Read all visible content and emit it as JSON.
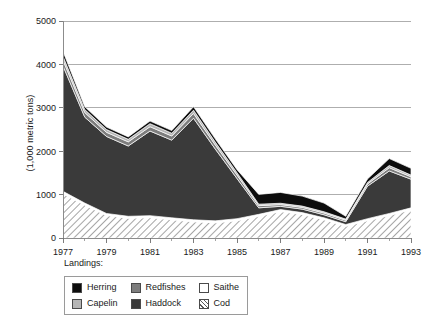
{
  "chart_data": {
    "type": "area",
    "stacked": true,
    "title": "",
    "xlabel": "",
    "ylabel": "(1,000 metric tons)",
    "legend_title": "Landings:",
    "legend_position": "bottom",
    "grid": true,
    "xlim": [
      1977,
      1993
    ],
    "ylim": [
      0,
      5000
    ],
    "yticks": [
      0,
      1000,
      2000,
      3000,
      4000,
      5000
    ],
    "ytick_labels": [
      "0",
      "1000",
      "2000",
      "3000",
      "4000",
      "5000"
    ],
    "x": [
      1977,
      1978,
      1979,
      1980,
      1981,
      1982,
      1983,
      1984,
      1985,
      1986,
      1987,
      1988,
      1989,
      1990,
      1991,
      1992,
      1993
    ],
    "xtick_labels": [
      "1977",
      "1979",
      "1981",
      "1983",
      "1985",
      "1987",
      "1989",
      "1991",
      "1993"
    ],
    "xtick_values": [
      1977,
      1979,
      1981,
      1983,
      1985,
      1987,
      1989,
      1991,
      1993
    ],
    "minor_xticks": [
      1978,
      1980,
      1982,
      1984,
      1986,
      1988,
      1990,
      1992
    ],
    "series": [
      {
        "name": "Cod",
        "color": "#ffffff",
        "pattern": "diagonal-hatch",
        "order": 1,
        "values": [
          1020,
          760,
          520,
          455,
          470,
          420,
          375,
          350,
          400,
          500,
          610,
          540,
          420,
          270,
          400,
          520,
          650
        ]
      },
      {
        "name": "Saithe",
        "color": "#ffffff",
        "pattern": "solid",
        "order": 2,
        "values": [
          55,
          45,
          45,
          45,
          45,
          45,
          45,
          45,
          45,
          45,
          45,
          45,
          45,
          40,
          45,
          45,
          45
        ]
      },
      {
        "name": "Haddock",
        "color": "#3a3a3a",
        "pattern": "solid",
        "order": 3,
        "values": [
          2890,
          1980,
          1775,
          1620,
          1950,
          1790,
          2340,
          1655,
          925,
          150,
          75,
          80,
          70,
          65,
          750,
          980,
          660
        ]
      },
      {
        "name": "Redfishes",
        "color": "#7d7d7d",
        "pattern": "solid",
        "order": 4,
        "values": [
          130,
          105,
          95,
          95,
          100,
          95,
          110,
          95,
          80,
          50,
          40,
          40,
          40,
          35,
          50,
          75,
          55
        ]
      },
      {
        "name": "Capelin",
        "color": "#b5b5b5",
        "pattern": "solid",
        "order": 5,
        "values": [
          90,
          70,
          65,
          60,
          70,
          65,
          75,
          65,
          55,
          35,
          30,
          30,
          30,
          25,
          35,
          50,
          40
        ]
      },
      {
        "name": "Herring",
        "color": "#0d0d0d",
        "pattern": "solid",
        "order": 6,
        "values": [
          115,
          65,
          55,
          55,
          60,
          60,
          80,
          75,
          70,
          225,
          250,
          230,
          200,
          65,
          80,
          160,
          155
        ]
      }
    ],
    "totals": [
      4300,
      3025,
      2555,
      2330,
      2695,
      2475,
      3025,
      2285,
      1575,
      1005,
      1050,
      965,
      805,
      500,
      1360,
      1830,
      1605
    ]
  },
  "legend": {
    "caption": "Landings:",
    "columns": [
      [
        {
          "label": "Herring",
          "swatch": "herring-swatch"
        },
        {
          "label": "Capelin",
          "swatch": "capelin-swatch"
        }
      ],
      [
        {
          "label": "Redfishes",
          "swatch": "redfishes-swatch"
        },
        {
          "label": "Haddock",
          "swatch": "haddock-swatch"
        }
      ],
      [
        {
          "label": "Saithe",
          "swatch": "saithe-swatch"
        },
        {
          "label": "Cod",
          "swatch": "cod-swatch"
        }
      ]
    ]
  },
  "axis": {
    "y_title": "(1,000 metric tons)"
  }
}
